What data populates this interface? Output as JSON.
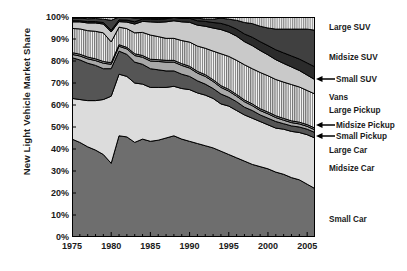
{
  "chart_data": {
    "type": "area",
    "title": "",
    "xlabel": "",
    "ylabel": "New Light Vehicle Market Share",
    "xlim": [
      1975,
      2006
    ],
    "ylim": [
      0,
      100
    ],
    "grid": false,
    "legend_position": "right",
    "stacked": true,
    "percent_axis": true,
    "x": [
      1975,
      1976,
      1977,
      1978,
      1979,
      1980,
      1981,
      1982,
      1983,
      1984,
      1985,
      1986,
      1987,
      1988,
      1989,
      1990,
      1991,
      1992,
      1993,
      1994,
      1995,
      1996,
      1997,
      1998,
      1999,
      2000,
      2001,
      2002,
      2003,
      2004,
      2005,
      2006
    ],
    "xticks": [
      "1975",
      "1980",
      "1985",
      "1990",
      "1995",
      "2000",
      "2005"
    ],
    "xtick_values": [
      1975,
      1980,
      1985,
      1990,
      1995,
      2000,
      2005
    ],
    "yticks": [
      "0%",
      "10%",
      "20%",
      "30%",
      "40%",
      "50%",
      "60%",
      "70%",
      "80%",
      "90%",
      "100%"
    ],
    "ytick_values": [
      0,
      10,
      20,
      30,
      40,
      50,
      60,
      70,
      80,
      90,
      100
    ],
    "series": [
      {
        "name": "Small Car",
        "fill": "#6e6e6e",
        "pattern": "solid",
        "values": [
          44.5,
          43.0,
          41.0,
          39.5,
          37.5,
          33.5,
          46.0,
          45.5,
          43.0,
          44.5,
          43.5,
          44.0,
          45.0,
          46.0,
          44.5,
          43.5,
          42.5,
          41.5,
          40.5,
          39.0,
          37.5,
          36.0,
          34.5,
          33.0,
          32.0,
          31.0,
          29.5,
          28.5,
          27.0,
          26.0,
          24.0,
          22.0
        ]
      },
      {
        "name": "Midsize Car",
        "fill": "#dcdcdc",
        "pattern": "solid",
        "values": [
          18.5,
          19.5,
          21.0,
          22.5,
          25.0,
          30.5,
          28.0,
          27.5,
          27.0,
          25.0,
          24.5,
          24.0,
          23.0,
          22.5,
          23.0,
          23.5,
          23.0,
          23.0,
          22.5,
          21.5,
          22.0,
          21.5,
          21.0,
          21.0,
          20.5,
          20.0,
          20.0,
          20.5,
          21.0,
          21.5,
          22.5,
          23.0
        ]
      },
      {
        "name": "Large Car",
        "fill": "#555555",
        "pattern": "solid",
        "values": [
          18.5,
          18.0,
          17.0,
          16.0,
          14.0,
          12.5,
          10.5,
          10.0,
          9.5,
          9.0,
          8.5,
          8.0,
          7.5,
          7.0,
          6.5,
          6.0,
          5.5,
          5.0,
          4.5,
          4.5,
          4.0,
          4.0,
          3.5,
          3.5,
          3.0,
          3.0,
          3.0,
          2.5,
          2.5,
          2.5,
          2.5,
          2.5
        ]
      },
      {
        "name": "Small Pickup",
        "fill": "#a8a8a8",
        "pattern": "solid",
        "values": [
          1.5,
          1.8,
          2.0,
          2.2,
          2.5,
          2.0,
          2.2,
          2.5,
          3.0,
          3.2,
          3.5,
          3.8,
          4.0,
          4.0,
          4.0,
          3.8,
          3.5,
          3.5,
          3.2,
          3.0,
          2.8,
          2.5,
          2.5,
          2.2,
          2.0,
          2.0,
          1.8,
          1.6,
          1.5,
          1.4,
          1.3,
          1.2
        ]
      },
      {
        "name": "Midsize Pickup",
        "fill": "#9a9a9a",
        "pattern": "solid",
        "values": [
          0.8,
          0.8,
          0.8,
          0.8,
          0.8,
          0.7,
          0.7,
          0.7,
          0.8,
          0.8,
          0.8,
          0.8,
          0.8,
          0.8,
          0.8,
          0.8,
          0.8,
          0.8,
          0.8,
          0.8,
          0.8,
          0.8,
          0.8,
          0.8,
          0.8,
          0.8,
          0.8,
          0.8,
          0.8,
          0.8,
          0.8,
          0.8
        ]
      },
      {
        "name": "Large Pickup",
        "fill": "#787878",
        "pattern": "vertical-hatch",
        "values": [
          11.0,
          11.5,
          12.0,
          12.5,
          13.0,
          9.5,
          8.0,
          8.5,
          9.5,
          10.5,
          11.0,
          10.5,
          10.0,
          10.0,
          10.5,
          11.0,
          11.5,
          12.0,
          13.0,
          14.5,
          15.0,
          15.5,
          16.0,
          16.0,
          16.5,
          16.5,
          16.5,
          16.5,
          16.5,
          16.0,
          15.5,
          15.5
        ]
      },
      {
        "name": "Vans",
        "fill": "#c9c9c9",
        "pattern": "solid",
        "values": [
          3.0,
          3.2,
          3.5,
          3.8,
          4.0,
          4.5,
          2.5,
          3.0,
          4.0,
          5.0,
          6.0,
          6.5,
          7.5,
          8.0,
          8.5,
          9.0,
          9.5,
          10.0,
          10.5,
          11.0,
          11.0,
          11.0,
          10.5,
          10.5,
          10.0,
          9.5,
          9.0,
          8.5,
          8.0,
          7.5,
          7.0,
          6.5
        ]
      },
      {
        "name": "Small SUV",
        "fill": "#2b2b2b",
        "pattern": "solid",
        "values": [
          0.5,
          0.5,
          0.6,
          0.6,
          0.7,
          0.8,
          0.8,
          0.9,
          1.0,
          1.1,
          1.2,
          1.3,
          1.4,
          1.5,
          1.6,
          1.8,
          2.0,
          2.2,
          2.5,
          2.8,
          3.0,
          3.2,
          3.5,
          3.8,
          4.0,
          4.2,
          4.5,
          4.8,
          5.0,
          5.2,
          5.5,
          5.8
        ]
      },
      {
        "name": "Midsize SUV",
        "fill": "#404040",
        "pattern": "solid",
        "values": [
          1.2,
          1.2,
          1.3,
          1.4,
          1.5,
          4.5,
          1.3,
          1.4,
          1.7,
          0.5,
          0.5,
          0.6,
          0.3,
          0.2,
          0.2,
          0.3,
          1.2,
          1.0,
          1.5,
          2.4,
          2.9,
          4.0,
          5.2,
          6.2,
          7.0,
          8.0,
          9.4,
          10.8,
          12.2,
          13.6,
          15.4,
          16.7
        ]
      },
      {
        "name": "Large SUV",
        "fill": "#8c8c8c",
        "pattern": "vertical-hatch",
        "values": [
          0.5,
          0.5,
          0.8,
          0.7,
          1.0,
          1.5,
          0.0,
          0.0,
          0.5,
          0.4,
          0.5,
          0.5,
          0.5,
          0.0,
          0.4,
          0.3,
          0.5,
          1.0,
          1.0,
          0.5,
          1.0,
          1.5,
          2.5,
          3.0,
          4.2,
          5.0,
          5.5,
          5.5,
          5.5,
          5.5,
          5.5,
          6.0
        ]
      }
    ],
    "legend_entries": [
      {
        "label": "Large SUV",
        "arrow": false,
        "y": 27
      },
      {
        "label": "Midsize SUV",
        "arrow": false,
        "y": 57
      },
      {
        "label": "Small SUV",
        "arrow": true,
        "y": 79
      },
      {
        "label": "Vans",
        "arrow": false,
        "y": 97
      },
      {
        "label": "Large Pickup",
        "arrow": false,
        "y": 110
      },
      {
        "label": "Midsize Pickup",
        "arrow": true,
        "y": 125
      },
      {
        "label": "Small Pickup",
        "arrow": true,
        "y": 136
      },
      {
        "label": "Large Car",
        "arrow": false,
        "y": 150
      },
      {
        "label": "Midsize Car",
        "arrow": false,
        "y": 168
      },
      {
        "label": "Small Car",
        "arrow": false,
        "y": 219
      }
    ]
  }
}
